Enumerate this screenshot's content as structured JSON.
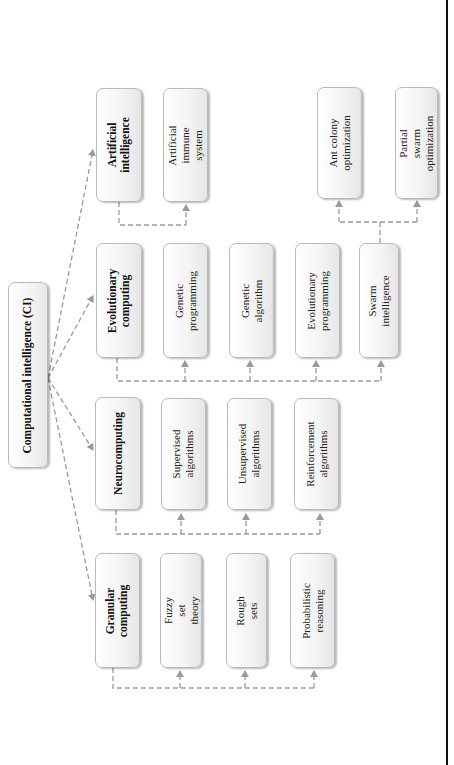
{
  "diagram": {
    "title": "Computational intelligence (CI)",
    "orientation": "rotated-90-ccw",
    "colors": {
      "box_border": "#b9b9b9",
      "box_fill": "#f4f4f4",
      "connector": "#999999",
      "frame_line": "#111111"
    },
    "root": {
      "id": "ci",
      "label": "Computational intelligence (CI)"
    },
    "branches": [
      {
        "id": "ai",
        "label": "Artificial\nintelligence",
        "children": [
          {
            "id": "ais",
            "label": "Artificial immune\nsystem"
          }
        ]
      },
      {
        "id": "evo",
        "label": "Evolutionary\ncomputing",
        "children": [
          {
            "id": "gp",
            "label": "Genetic\nprogramming"
          },
          {
            "id": "ga",
            "label": "Genetic algorithm"
          },
          {
            "id": "ep",
            "label": "Evolutionary\nprogramming"
          },
          {
            "id": "si",
            "label": "Swarm intelligence",
            "children": [
              {
                "id": "aco",
                "label": "Ant colony\noptimization"
              },
              {
                "id": "pso",
                "label": "Partial swarm\noptimization"
              }
            ]
          }
        ]
      },
      {
        "id": "neuro",
        "label": "Neurocomputing",
        "children": [
          {
            "id": "sup",
            "label": "Supervised\nalgorithms"
          },
          {
            "id": "unsup",
            "label": "Unsupervised\nalgorithms"
          },
          {
            "id": "rl",
            "label": "Reinforcement\nalgorithms"
          }
        ]
      },
      {
        "id": "gran",
        "label": "Granular\ncomputing",
        "children": [
          {
            "id": "fuzzy",
            "label": "Fuzzy set theory"
          },
          {
            "id": "rough",
            "label": "Rough sets"
          },
          {
            "id": "prob",
            "label": "Probabilistic\nreasoning"
          }
        ]
      }
    ]
  }
}
